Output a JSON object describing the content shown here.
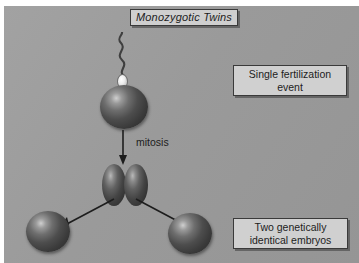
{
  "figure": {
    "title": "Monozygotic Twins",
    "background_color": "#9b9b9b",
    "box_fill_color": "#d0d0d0",
    "box_border_color": "#3a3a3a",
    "cell_color": "#3a3a3a",
    "sperm_head_color": "#ececec"
  },
  "labels": {
    "fertilization": {
      "line1": "Single fertilization",
      "line2": "event"
    },
    "embryos": {
      "line1": "Two genetically",
      "line2": "identical embryos"
    },
    "mitosis": "mitosis"
  },
  "diagram_elements": {
    "sperm": "sperm-cell",
    "zygote": "zygote-cell",
    "two_cell_stage": "two-cell-stage",
    "embryo_left": "embryo-cell-left",
    "embryo_right": "embryo-cell-right",
    "arrow_down": "mitosis-arrow",
    "arrow_split_left": "split-arrow-left",
    "arrow_split_right": "split-arrow-right"
  }
}
